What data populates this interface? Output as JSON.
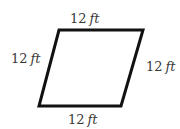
{
  "diagram": {
    "type": "rhombus",
    "stroke_color": "#111111",
    "fill_color": "#ffffff",
    "label_color": "#3a3a3a",
    "vertices": {
      "top_left": [
        59,
        30
      ],
      "top_right": [
        143,
        30
      ],
      "bottom_right": [
        121,
        106
      ],
      "bottom_left": [
        39,
        106
      ]
    },
    "labels": {
      "top": {
        "value": "12",
        "unit": "ft"
      },
      "left": {
        "value": "12",
        "unit": "ft"
      },
      "right": {
        "value": "12",
        "unit": "ft"
      },
      "bottom": {
        "value": "12",
        "unit": "ft"
      }
    }
  }
}
